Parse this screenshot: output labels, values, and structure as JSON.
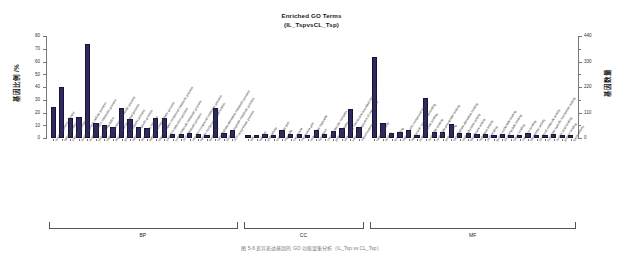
{
  "title": {
    "line1": "Enriched GO Terms",
    "line2": "(IL_TspvsCL_Tsp)"
  },
  "axes": {
    "left_label": "基因比例 /%",
    "right_label": "基因数量",
    "left_ticks": [
      "0",
      "10",
      "20",
      "30",
      "40",
      "50",
      "60",
      "70",
      "80"
    ],
    "right_ticks": [
      "0",
      "110",
      "220",
      "330",
      "440"
    ],
    "left_range": [
      0,
      80
    ],
    "right_range": [
      0,
      440
    ]
  },
  "groups": [
    {
      "id": "BP",
      "label": "BP"
    },
    {
      "id": "CC",
      "label": "CC"
    },
    {
      "id": "MF",
      "label": "MF"
    }
  ],
  "caption": "图 5-6  差异表达基因的 GO 功能富集分析（IL_Tsp vs CL_Tsp）",
  "colors": {
    "bar": "#2e2a5e",
    "bar_edge": "#16133a",
    "axis": "#777777",
    "text": "#1a1a1a"
  },
  "chart_data": {
    "type": "bar",
    "title": "Enriched GO Terms (IL_TspvsCL_Tsp)",
    "xlabel": "",
    "ylabel": "基因比例 /%",
    "ylabel_right": "基因数量",
    "ylim": [
      0,
      80
    ],
    "ylim_right": [
      0,
      440
    ],
    "grid": false,
    "legend": "none",
    "categories": [
      "single-organism process",
      "cellular process",
      "metabolic process",
      "single-organism cellular process",
      "single-organism metabolic process",
      "biological regulation",
      "organic substance metabolic process",
      "regulation of biological process",
      "primary metabolic process",
      "cellular metabolic process",
      "response to stimulus",
      "cellular and biosynthetic process",
      "organonitrogen compound metabolic process",
      "oxidation-reduction process",
      "small molecule metabolic process",
      "ATP metabolic process",
      "nitrogen compound metabolic process",
      "cellular component organization",
      "localization",
      "carbohydrate derivative metabolic process",
      "ribose phosphate metabolic process",
      "ATP biosynthetic process",
      "cell",
      "cell part",
      "intracellular",
      "intracellular part",
      "organelle",
      "membrane",
      "membrane part",
      "intracellular organelle",
      "cytoplasm",
      "macromolecular complex",
      "protein complex",
      "intracellular membrane-bounded organelle",
      "integral component of membrane",
      "mitochondrion",
      "catalytic activity",
      "binding",
      "ion binding",
      "organic cyclic compound binding",
      "heterocyclic compound binding",
      "small molecule binding",
      "nucleotide binding",
      "nucleoside phosphate binding",
      "anion binding",
      "carbohydrate derivative binding",
      "oxidoreductase activity",
      "transferase activity",
      "hydrolase activity",
      "ATP binding",
      "purine nucleotide binding",
      "ribonucleotide binding",
      "cation binding",
      "metal ion binding",
      "transporter activity",
      "structural molecule activity",
      "substrate-specific transporter activity",
      "nucleic acid binding",
      "protein binding",
      "lyase activity"
    ],
    "groups": [
      "BP",
      "BP",
      "BP",
      "BP",
      "BP",
      "BP",
      "BP",
      "BP",
      "BP",
      "BP",
      "BP",
      "BP",
      "BP",
      "BP",
      "BP",
      "BP",
      "BP",
      "BP",
      "BP",
      "BP",
      "BP",
      "BP",
      "CC",
      "CC",
      "CC",
      "CC",
      "CC",
      "CC",
      "CC",
      "CC",
      "CC",
      "CC",
      "CC",
      "CC",
      "CC",
      "CC",
      "MF",
      "MF",
      "MF",
      "MF",
      "MF",
      "MF",
      "MF",
      "MF",
      "MF",
      "MF",
      "MF",
      "MF",
      "MF",
      "MF",
      "MF",
      "MF",
      "MF",
      "MF",
      "MF",
      "MF",
      "MF",
      "MF",
      "MF",
      "MF"
    ],
    "values": [
      24.5,
      40.0,
      16.0,
      16.5,
      74.0,
      11.5,
      10.0,
      9.0,
      23.5,
      15.0,
      8.5,
      8.0,
      15.5,
      15.5,
      3.5,
      3.0,
      4.0,
      3.0,
      2.5,
      23.5,
      4.0,
      6.0,
      2.5,
      2.5,
      3.0,
      2.5,
      6.0,
      3.0,
      3.5,
      2.5,
      6.5,
      3.5,
      5.5,
      7.5,
      23.0,
      8.5,
      63.5,
      12.0,
      4.0,
      4.5,
      6.0,
      2.5,
      31.0,
      4.5,
      5.0,
      11.0,
      4.0,
      4.0,
      3.0,
      3.5,
      2.5,
      3.5,
      2.0,
      2.5,
      4.0,
      2.0,
      2.5,
      3.0,
      2.0,
      2.5
    ],
    "series": [
      {
        "name": "基因比例 /%",
        "values": [
          24.5,
          40.0,
          16.0,
          16.5,
          74.0,
          11.5,
          10.0,
          9.0,
          23.5,
          15.0,
          8.5,
          8.0,
          15.5,
          15.5,
          3.5,
          3.0,
          4.0,
          3.0,
          2.5,
          23.5,
          4.0,
          6.0,
          2.5,
          2.5,
          3.0,
          2.5,
          6.0,
          3.0,
          3.5,
          2.5,
          6.5,
          3.5,
          5.5,
          7.5,
          23.0,
          8.5,
          63.5,
          12.0,
          4.0,
          4.5,
          6.0,
          2.5,
          31.0,
          4.5,
          5.0,
          11.0,
          4.0,
          4.0,
          3.0,
          3.5,
          2.5,
          3.5,
          2.0,
          2.5,
          4.0,
          2.0,
          2.5,
          3.0,
          2.0,
          2.5
        ]
      }
    ]
  }
}
